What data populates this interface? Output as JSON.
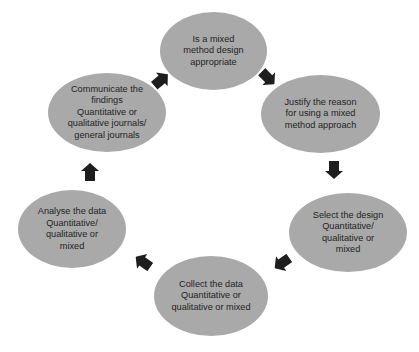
{
  "diagram": {
    "type": "cycle",
    "colors": {
      "node_fill": "#a9a9a9",
      "text": "#1f1f1f",
      "arrow": "#1e1e1e",
      "background": "#ffffff"
    },
    "nodes": [
      {
        "id": "decide",
        "label": "Is a mixed\nmethod design\nappropriate",
        "cx": 214,
        "cy": 51,
        "w": 107,
        "h": 78
      },
      {
        "id": "justify",
        "label": "Justify the reason\nfor using a mixed\nmethod approach",
        "cx": 320,
        "cy": 114,
        "w": 119,
        "h": 78
      },
      {
        "id": "select",
        "label": "Select the design\nQuantitative/\nqualitative or\nmixed",
        "cx": 348,
        "cy": 232,
        "w": 118,
        "h": 79
      },
      {
        "id": "collect",
        "label": "Collect the data\nQuantitative or\nqualitative or mixed",
        "cx": 211,
        "cy": 296,
        "w": 114,
        "h": 80
      },
      {
        "id": "analyse",
        "label": "Analyse the data\nQuantitative/\nqualitative or\nmixed",
        "cx": 72,
        "cy": 229,
        "w": 108,
        "h": 78
      },
      {
        "id": "communicate",
        "label": "Communicate the\nfindings\nQuantitative or\nqualitative journals/\ngeneral journals",
        "cx": 107,
        "cy": 113,
        "w": 118,
        "h": 79
      }
    ],
    "edges": [
      {
        "from": "decide",
        "to": "justify",
        "x": 268,
        "y": 78,
        "angle": 135
      },
      {
        "from": "justify",
        "to": "select",
        "x": 334,
        "y": 170,
        "angle": 180
      },
      {
        "from": "select",
        "to": "collect",
        "x": 282,
        "y": 263,
        "angle": 235
      },
      {
        "from": "collect",
        "to": "analyse",
        "x": 143,
        "y": 262,
        "angle": 305
      },
      {
        "from": "analyse",
        "to": "communicate",
        "x": 90,
        "y": 172,
        "angle": 0
      },
      {
        "from": "communicate",
        "to": "decide",
        "x": 161,
        "y": 80,
        "angle": 50
      }
    ]
  }
}
